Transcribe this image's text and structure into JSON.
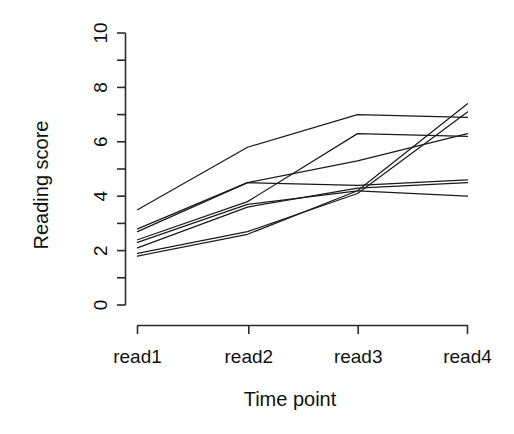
{
  "chart_data": {
    "type": "line",
    "title": "",
    "subtitle": "",
    "xlabel": "Time point",
    "ylabel": "Reading score",
    "categories": [
      "read1",
      "read2",
      "read3",
      "read4"
    ],
    "x": [
      1,
      2,
      3,
      4
    ],
    "xlim": [
      0.75,
      4.25
    ],
    "ylim": [
      0,
      10
    ],
    "yticks": [
      0,
      2,
      4,
      6,
      8,
      10
    ],
    "yticklabels": [
      "0",
      "2",
      "4",
      "6",
      "8",
      "10"
    ],
    "y_minor_ticks": [
      1,
      3,
      5,
      7,
      9
    ],
    "xticklabels": [
      "read1",
      "read2",
      "read3",
      "read4"
    ],
    "grid": false,
    "legend": "none",
    "line_color": "#1b1b1b",
    "background_color": "#ffffff",
    "series": [
      {
        "name": "subject-1",
        "values": [
          3.5,
          5.8,
          7.0,
          6.9
        ]
      },
      {
        "name": "subject-2",
        "values": [
          2.7,
          4.5,
          5.3,
          6.3
        ]
      },
      {
        "name": "subject-3",
        "values": [
          2.8,
          4.5,
          4.4,
          4.6
        ]
      },
      {
        "name": "subject-4",
        "values": [
          2.4,
          3.8,
          6.3,
          6.2
        ]
      },
      {
        "name": "subject-5",
        "values": [
          2.3,
          3.7,
          4.2,
          7.4
        ]
      },
      {
        "name": "subject-6",
        "values": [
          2.1,
          3.6,
          4.3,
          4.5
        ]
      },
      {
        "name": "subject-7",
        "values": [
          1.9,
          2.7,
          4.1,
          7.1
        ]
      },
      {
        "name": "subject-8",
        "values": [
          1.8,
          2.6,
          4.2,
          4.0
        ]
      }
    ]
  },
  "axes": {
    "y_title": "Reading score",
    "x_title": "Time point",
    "y_tick_labels": [
      "0",
      "2",
      "4",
      "6",
      "8",
      "10"
    ],
    "x_tick_labels": [
      "read1",
      "read2",
      "read3",
      "read4"
    ]
  }
}
